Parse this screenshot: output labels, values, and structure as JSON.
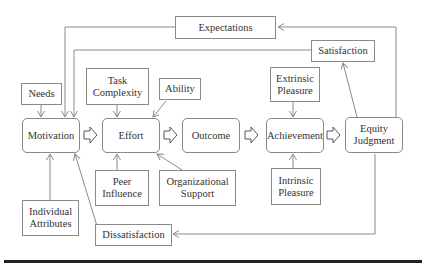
{
  "diagram": {
    "nodes": {
      "expectations": "Expectations",
      "satisfaction": "Satisfaction",
      "needs": "Needs",
      "task_complexity": "Task Complexity",
      "ability": "Ability",
      "extrinsic_pleasure": "Extrinsic Pleasure",
      "motivation": "Motivation",
      "effort": "Effort",
      "outcome": "Outcome",
      "achievement": "Achievement",
      "equity_judgment": "Equity Judgment",
      "peer_influence": "Peer Influence",
      "organizational_support": "Organizational Support",
      "intrinsic_pleasure": "Intrinsic Pleasure",
      "individual_attributes": "Individual Attributes",
      "dissatisfaction": "Dissatisfaction"
    },
    "main_flow": [
      "Motivation",
      "Effort",
      "Outcome",
      "Achievement",
      "Equity Judgment"
    ],
    "edges": [
      {
        "from": "Needs",
        "to": "Motivation"
      },
      {
        "from": "Expectations",
        "to": "Motivation"
      },
      {
        "from": "Satisfaction",
        "to": "Motivation"
      },
      {
        "from": "Individual Attributes",
        "to": "Motivation"
      },
      {
        "from": "Dissatisfaction",
        "to": "Motivation"
      },
      {
        "from": "Task Complexity",
        "to": "Effort"
      },
      {
        "from": "Ability",
        "to": "Effort"
      },
      {
        "from": "Peer Influence",
        "to": "Effort"
      },
      {
        "from": "Organizational Support",
        "to": "Effort"
      },
      {
        "from": "Extrinsic Pleasure",
        "to": "Achievement"
      },
      {
        "from": "Intrinsic Pleasure",
        "to": "Achievement"
      },
      {
        "from": "Equity Judgment",
        "to": "Satisfaction"
      },
      {
        "from": "Equity Judgment",
        "to": "Expectations"
      },
      {
        "from": "Equity Judgment",
        "to": "Dissatisfaction"
      }
    ],
    "colors": {
      "line": "#8a8a8a",
      "text": "#333333",
      "rule": "#222222"
    }
  }
}
